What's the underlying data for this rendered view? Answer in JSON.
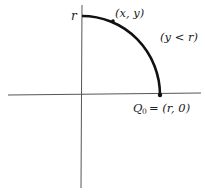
{
  "diagram": {
    "type": "quarter-circle path in first quadrant",
    "labels": {
      "radius_tick": "r",
      "moving_point": "(x, y)",
      "condition": "(y < r)",
      "start_point_name": "Q",
      "start_point_subscript": "0",
      "start_point_coords": "= (r, 0)"
    },
    "colors": {
      "axes": "#555555",
      "arc": "#111111",
      "text": "#222222"
    }
  }
}
